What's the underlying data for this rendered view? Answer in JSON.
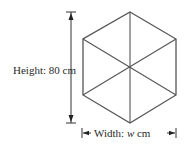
{
  "figure": {
    "shape": "regular hexagon divided into 6 triangles",
    "height_label": "Height: 80 cm",
    "width_label_prefix": "Width: ",
    "width_variable": "w",
    "width_label_suffix": " cm",
    "colors": {
      "line": "#555555",
      "text": "#2a2a2a",
      "background": "#ffffff"
    }
  }
}
